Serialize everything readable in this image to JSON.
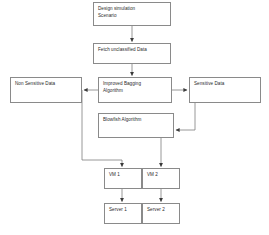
{
  "diagram": {
    "type": "flowchart",
    "canvas": {
      "width": 269,
      "height": 235
    },
    "style": {
      "box_border_color": "#8a8a8a",
      "box_fill_color": "#ffffff",
      "connector_color": "#7d7d7d",
      "arrow_color": "#3a3a3a",
      "text_color": "#2b2b2b"
    },
    "nodes": [
      {
        "id": "design-simulation-scenario",
        "label": "Design simulation\nScenario",
        "x": 93,
        "y": 2,
        "w": 78,
        "h": 24
      },
      {
        "id": "fetch-unclassified-data",
        "label": "Fetch unclassified Data",
        "x": 93,
        "y": 43,
        "w": 78,
        "h": 21
      },
      {
        "id": "non-sensitive-data",
        "label": "Non Sensitive Data",
        "x": 10,
        "y": 77,
        "w": 72,
        "h": 26
      },
      {
        "id": "improved-bagging-algorithm",
        "label": "Improved Bagging\nAlgorithm",
        "x": 98,
        "y": 77,
        "w": 74,
        "h": 26
      },
      {
        "id": "sensitive-data",
        "label": "Sensitive Data",
        "x": 189,
        "y": 77,
        "w": 72,
        "h": 26
      },
      {
        "id": "blowfish-algorithm",
        "label": "Blowfish Algorithm",
        "x": 98,
        "y": 113,
        "w": 76,
        "h": 25
      },
      {
        "id": "vm-1",
        "label": "VM 1",
        "x": 104,
        "y": 168,
        "w": 38,
        "h": 21
      },
      {
        "id": "vm-2",
        "label": "VM 2",
        "x": 142,
        "y": 168,
        "w": 38,
        "h": 21
      },
      {
        "id": "server-1",
        "label": "Server 1",
        "x": 104,
        "y": 203,
        "w": 38,
        "h": 21
      },
      {
        "id": "server-2",
        "label": "Server 2",
        "x": 142,
        "y": 203,
        "w": 38,
        "h": 21
      }
    ],
    "edges": [
      {
        "id": "e1",
        "from": "design-simulation-scenario",
        "to": "fetch-unclassified-data"
      },
      {
        "id": "e2",
        "from": "fetch-unclassified-data",
        "to": "improved-bagging-algorithm"
      },
      {
        "id": "e3",
        "from": "improved-bagging-algorithm",
        "to": "non-sensitive-data"
      },
      {
        "id": "e4",
        "from": "improved-bagging-algorithm",
        "to": "sensitive-data"
      },
      {
        "id": "e5",
        "from": "sensitive-data",
        "to": "blowfish-algorithm"
      },
      {
        "id": "e6",
        "from": "non-sensitive-data",
        "to": "vm-1"
      },
      {
        "id": "e7",
        "from": "blowfish-algorithm",
        "to": "vm-2"
      },
      {
        "id": "e8",
        "from": "vm-1",
        "to": "server-1"
      },
      {
        "id": "e9",
        "from": "vm-2",
        "to": "server-2"
      }
    ]
  }
}
